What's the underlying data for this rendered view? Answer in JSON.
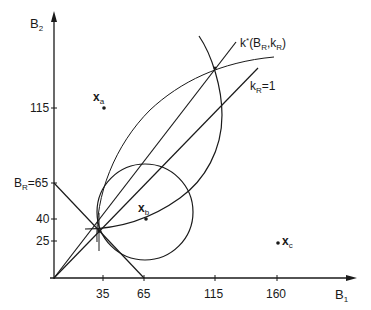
{
  "axes": {
    "x_label_main": "B",
    "x_label_sub": "1",
    "y_label_main": "B",
    "y_label_sub": "2",
    "x_ticks": [
      "35",
      "65",
      "115",
      "160"
    ],
    "y_ticks": [
      "115",
      "40",
      "25"
    ],
    "br_label_main": "B",
    "br_label_sub": "R",
    "br_label_value": "=65"
  },
  "curves": {
    "kstar_label_main": "k",
    "kstar_label_sup": "*",
    "kstar_label_args_open": "(B",
    "kstar_label_args_sub1": "R",
    "kstar_label_args_mid": ",k",
    "kstar_label_args_sub2": "R",
    "kstar_label_args_close": ")",
    "kr_label_main": "k",
    "kr_label_sub": "R",
    "kr_label_value": "=1"
  },
  "points": {
    "xa_main": "x",
    "xa_sub": "a",
    "xb_main": "x",
    "xb_sub": "b",
    "xc_main": "x",
    "xc_sub": "c"
  },
  "colors": {
    "ink": "#1a1a1a",
    "background": "#ffffff"
  }
}
